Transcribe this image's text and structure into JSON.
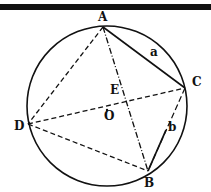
{
  "figure": {
    "points": {
      "A": {
        "label": "A",
        "x": 103,
        "y": 27
      },
      "B": {
        "label": "B",
        "x": 148,
        "y": 171
      },
      "C": {
        "label": "C",
        "x": 185,
        "y": 88
      },
      "D": {
        "label": "D",
        "x": 28,
        "y": 124
      },
      "E": {
        "label": "E",
        "x": 125,
        "y": 101
      },
      "O": {
        "label": "O",
        "x": 107,
        "y": 110
      }
    },
    "segment_labels": {
      "a": "a",
      "b": "b"
    },
    "circle": {
      "cx": 107,
      "cy": 106,
      "r": 80
    }
  }
}
